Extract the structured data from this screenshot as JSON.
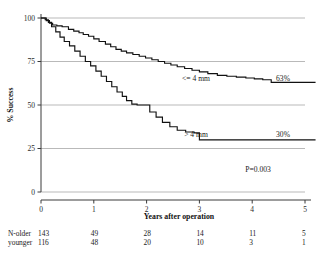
{
  "chart_data": {
    "type": "line",
    "title": "",
    "xlabel": "Years after operation",
    "ylabel": "% Success",
    "xlim": [
      0,
      5
    ],
    "ylim": [
      0,
      100
    ],
    "xticks": [
      0,
      1,
      2,
      3,
      4,
      5
    ],
    "yticks": [
      0,
      25,
      50,
      75,
      100
    ],
    "xtick_labels": [
      "0",
      "1",
      "2",
      "3",
      "4",
      "5"
    ],
    "ytick_labels": [
      "0",
      "25",
      "50",
      "75",
      "100"
    ],
    "grid": "horizontal",
    "legend_position": "in-plot-annotations",
    "annotations": {
      "pvalue": "P=0.003"
    },
    "series": [
      {
        "name": "<= 4 mm",
        "label": "<= 4 mm",
        "endpoint_label": "63%",
        "color": "#111111",
        "step": "post",
        "x": [
          0.0,
          0.1,
          0.16,
          0.22,
          0.3,
          0.4,
          0.52,
          0.62,
          0.72,
          0.8,
          0.9,
          1.0,
          1.1,
          1.22,
          1.32,
          1.42,
          1.52,
          1.62,
          1.74,
          1.86,
          1.98,
          2.1,
          2.22,
          2.34,
          2.46,
          2.58,
          2.72,
          2.86,
          3.0,
          3.16,
          3.34,
          3.52,
          3.7,
          3.88,
          4.04,
          4.2,
          4.36,
          5.2
        ],
        "y": [
          100.0,
          98.5,
          97.0,
          96.0,
          95.5,
          95.0,
          93.5,
          92.5,
          91.5,
          90.5,
          89.5,
          88.0,
          86.5,
          85.0,
          83.5,
          82.0,
          81.0,
          80.0,
          79.0,
          78.0,
          77.0,
          76.0,
          75.0,
          74.0,
          73.0,
          72.0,
          71.0,
          70.0,
          69.0,
          68.0,
          67.0,
          66.5,
          66.0,
          65.5,
          65.0,
          64.5,
          63.0,
          63.0
        ]
      },
      {
        "name": "> 4 mm",
        "label": "> 4 mm",
        "endpoint_label": "30%",
        "color": "#111111",
        "step": "post",
        "x": [
          0.0,
          0.08,
          0.14,
          0.2,
          0.28,
          0.36,
          0.44,
          0.54,
          0.64,
          0.74,
          0.84,
          0.94,
          1.04,
          1.14,
          1.24,
          1.34,
          1.44,
          1.54,
          1.62,
          1.72,
          1.82,
          1.94,
          2.06,
          2.18,
          2.3,
          2.44,
          2.58,
          2.74,
          2.9,
          3.0,
          5.2
        ],
        "y": [
          100.0,
          99.0,
          97.5,
          95.0,
          92.0,
          89.0,
          86.5,
          84.0,
          81.0,
          78.0,
          75.0,
          72.5,
          69.5,
          66.5,
          63.5,
          60.5,
          57.5,
          55.0,
          52.5,
          50.5,
          50.0,
          50.0,
          46.0,
          43.0,
          40.0,
          37.5,
          35.5,
          34.5,
          34.0,
          30.0,
          30.0
        ]
      }
    ]
  },
  "risk_table": {
    "row_labels": [
      "N-older",
      "younger"
    ],
    "rows": [
      {
        "label": "N-older",
        "values": [
          "143",
          "49",
          "28",
          "14",
          "11",
          "5"
        ]
      },
      {
        "label": "younger",
        "values": [
          "116",
          "48",
          "20",
          "10",
          "3",
          "1"
        ]
      }
    ]
  }
}
